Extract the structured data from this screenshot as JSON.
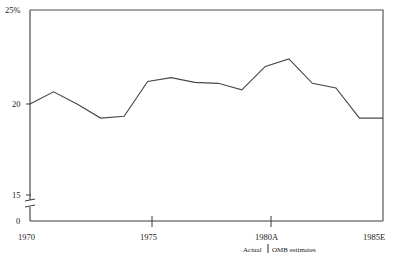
{
  "chart_data": {
    "type": "line",
    "title": "",
    "subtitle": "",
    "xlabel": "",
    "ylabel": "",
    "x": [
      1970,
      1971,
      1972,
      1973,
      1974,
      1975,
      1976,
      1977,
      1978,
      1979,
      1980,
      1981,
      1982,
      1983,
      1984,
      1985
    ],
    "values": [
      20.0,
      20.65,
      20.0,
      19.25,
      19.35,
      21.2,
      21.4,
      21.15,
      21.1,
      20.75,
      22.0,
      22.4,
      21.1,
      20.85,
      19.25,
      19.25
    ],
    "series": [
      {
        "name": "Outlays as percent of GNP",
        "values": [
          20.0,
          20.65,
          20.0,
          19.25,
          19.35,
          21.2,
          21.4,
          21.15,
          21.1,
          20.75,
          22.0,
          22.4,
          21.1,
          20.85,
          19.25,
          19.25
        ]
      }
    ],
    "ylim": [
      15,
      25
    ],
    "yticks": [
      25,
      20,
      15,
      0
    ],
    "ytick_labels": [
      "25%",
      "20",
      "15",
      "0"
    ],
    "y_axis_break": true,
    "y_axis_break_between": [
      0,
      15
    ],
    "xlim": [
      1970,
      1985
    ],
    "xticks": [
      1970,
      1975,
      1980,
      1985
    ],
    "xtick_labels": [
      "1970",
      "1975",
      "1980A",
      "1985E"
    ],
    "grid": false,
    "legend": "none",
    "annotations": [
      {
        "text_left": "Actual",
        "text_right": "OMB estimates",
        "divider": "|",
        "at_x": 1980,
        "position": "below-axis"
      }
    ],
    "line_color": "#45484d",
    "axis_color": "#3a3a3a",
    "background": "#ffffff"
  },
  "axis": {
    "y_labels": {
      "top": "25%",
      "mid": "20",
      "low": "15",
      "zero": "0"
    },
    "x_labels": {
      "start": "1970",
      "mid1": "1975",
      "mid2": "1980A",
      "end": "1985E"
    }
  },
  "caption": {
    "actual": "Actual",
    "divider": "|",
    "estimates": "OMB estimates"
  }
}
